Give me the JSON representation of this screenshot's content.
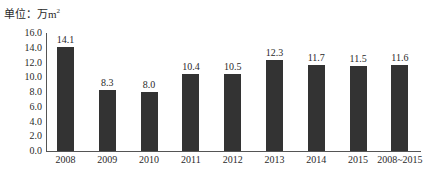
{
  "chart_data": {
    "type": "bar",
    "title": "",
    "unit_label": "单位：万m",
    "unit_sup": "2",
    "xlabel": "",
    "ylabel": "单位：万m²",
    "ylim": [
      0,
      16
    ],
    "yticks": [
      "0.0",
      "2.0",
      "4.0",
      "6.0",
      "8.0",
      "10.0",
      "12.0",
      "14.0",
      "16.0"
    ],
    "categories": [
      "2008",
      "2009",
      "2010",
      "2011",
      "2012",
      "2013",
      "2014",
      "2015",
      "2008~2015"
    ],
    "values": [
      14.1,
      8.3,
      8.0,
      10.4,
      10.5,
      12.3,
      11.7,
      11.5,
      11.6
    ],
    "value_labels": [
      "14.1",
      "8.3",
      "8.0",
      "10.4",
      "10.5",
      "12.3",
      "11.7",
      "11.5",
      "11.6"
    ],
    "grid": false,
    "legend": null,
    "bar_color": "#333333"
  }
}
